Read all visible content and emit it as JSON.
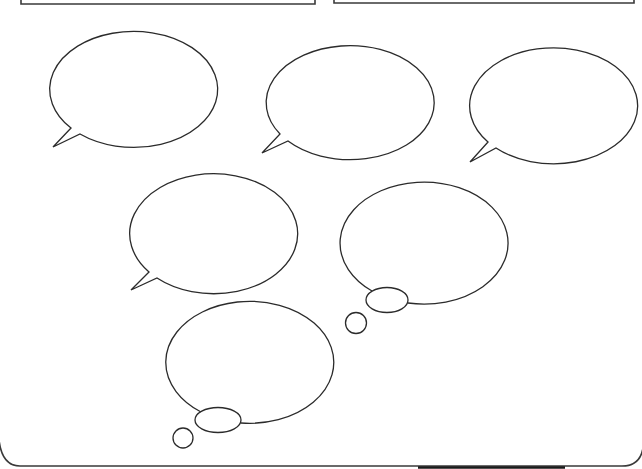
{
  "page": {
    "title": "",
    "background": "#ffffff",
    "line_color": "#2b2b2b"
  },
  "header_boxes": [
    {
      "id": "box-left",
      "text": ""
    },
    {
      "id": "box-right",
      "text": ""
    }
  ],
  "speech_bubbles": [
    {
      "id": "speech-1",
      "text": "",
      "tail": "bottom-left"
    },
    {
      "id": "speech-2",
      "text": "",
      "tail": "bottom-left"
    },
    {
      "id": "speech-3",
      "text": "",
      "tail": "bottom-left"
    },
    {
      "id": "speech-4",
      "text": "",
      "tail": "bottom-left"
    }
  ],
  "thought_bubbles": [
    {
      "id": "thought-1",
      "text": "",
      "tail": "bottom-left"
    },
    {
      "id": "thought-2",
      "text": "",
      "tail": "bottom-left"
    }
  ]
}
